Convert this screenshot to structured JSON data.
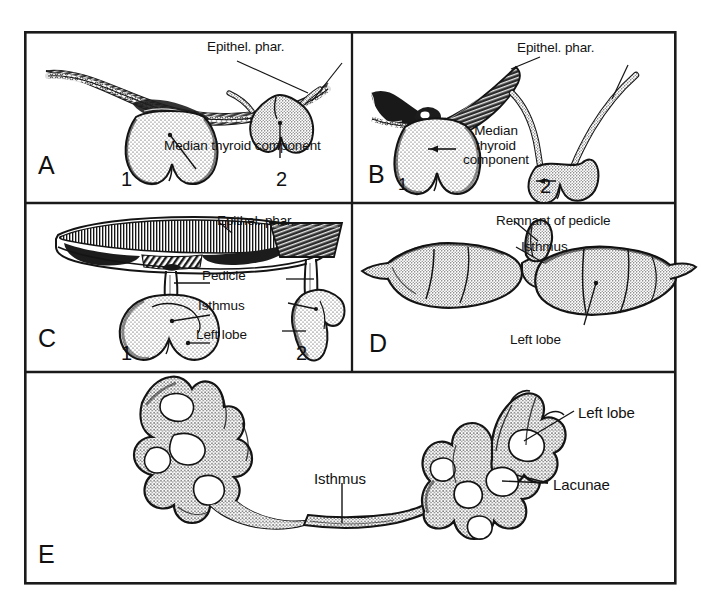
{
  "figure": {
    "background_color": "#ffffff",
    "ink_color": "#111111",
    "frame": {
      "x": 24,
      "y": 31,
      "width": 653,
      "height": 554,
      "border_color": "#1a1a1a"
    },
    "dividers": {
      "vertical_x": 352,
      "horizontal_y_1": 203,
      "horizontal_y_2": 372
    }
  },
  "panels": [
    {
      "id": "A",
      "letter": "A",
      "letter_pos": {
        "x": 14,
        "y": 122
      },
      "subfigures": [
        {
          "num": "1",
          "pos": {
            "x": 97,
            "y": 138
          }
        },
        {
          "num": "2",
          "pos": {
            "x": 252,
            "y": 138
          }
        }
      ],
      "labels": [
        {
          "text": "Epithel. phar.",
          "x": 183,
          "y": 8
        },
        {
          "text": "Median thyroid component",
          "x": 140,
          "y": 107
        }
      ]
    },
    {
      "id": "B",
      "letter": "B",
      "letter_pos": {
        "x": 344,
        "y": 131
      },
      "subfigures": [
        {
          "num": "1",
          "pos": {
            "x": 374,
            "y": 145
          }
        },
        {
          "num": "2",
          "pos": {
            "x": 516,
            "y": 145
          }
        }
      ],
      "labels": [
        {
          "text": "Epithel. phar.",
          "x": 493,
          "y": 9
        },
        {
          "text": "Median thyroid component",
          "x": 436,
          "y": 93,
          "multiline": true,
          "width": 72
        }
      ]
    },
    {
      "id": "C",
      "letter": "C",
      "letter_pos": {
        "x": 14,
        "y": 295
      },
      "subfigures": [
        {
          "num": "1",
          "pos": {
            "x": 97,
            "y": 312
          }
        },
        {
          "num": "2",
          "pos": {
            "x": 272,
            "y": 312
          }
        }
      ],
      "labels": [
        {
          "text": "Epithel. phar.",
          "x": 193,
          "y": 182
        },
        {
          "text": "Pedicle",
          "x": 178,
          "y": 237
        },
        {
          "text": "Isthmus",
          "x": 174,
          "y": 267
        },
        {
          "text": "Left lobe",
          "x": 172,
          "y": 296
        }
      ]
    },
    {
      "id": "D",
      "letter": "D",
      "letter_pos": {
        "x": 345,
        "y": 300
      },
      "subfigures": [],
      "labels": [
        {
          "text": "Remnant of pedicle",
          "x": 472,
          "y": 182
        },
        {
          "text": "Isthmus",
          "x": 497,
          "y": 208
        },
        {
          "text": "Left lobe",
          "x": 486,
          "y": 301
        }
      ]
    },
    {
      "id": "E",
      "letter": "E",
      "letter_pos": {
        "x": 14,
        "y": 511
      },
      "subfigures": [],
      "labels": [
        {
          "text": "Isthmus",
          "x": 290,
          "y": 440
        },
        {
          "text": "Left lobe",
          "x": 554,
          "y": 374
        },
        {
          "text": "Lacunae",
          "x": 529,
          "y": 446
        }
      ]
    }
  ]
}
